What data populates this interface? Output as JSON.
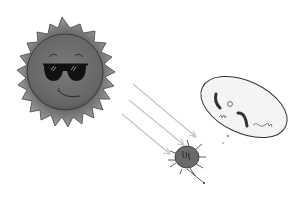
{
  "scene": {
    "description": "Cartoon sun wearing sunglasses emitting light rays toward a bacterium with a thought bubble",
    "colors": {
      "background": "#ffffff",
      "sun_fill": "#6e6e6e",
      "sun_edge": "#3a3a3a",
      "sun_rays": "#8a8a8a",
      "glasses": "#111111",
      "light_rays": "#c4c4c4",
      "bacterium_fill": "#6a6a6a",
      "bubble_fill": "#f4f4f4",
      "bubble_edge": "#333333"
    },
    "elements": {
      "sun": "sun-with-sunglasses",
      "rays": "three light arrows",
      "bacterium": "cell with flagella",
      "thought_bubble": "ellipse containing DNA fragments"
    }
  }
}
